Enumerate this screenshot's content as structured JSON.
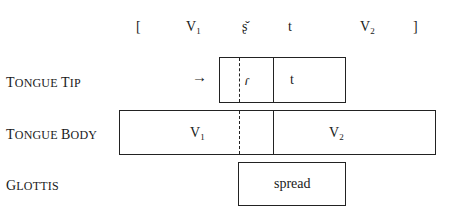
{
  "transcription": {
    "open_bracket": "[",
    "segments": [
      {
        "base": "V",
        "sub": "1"
      },
      {
        "base": "ʈ͡ʂ̌",
        "sub": ""
      },
      {
        "base": "t",
        "sub": ""
      },
      {
        "base": "V",
        "sub": "2"
      }
    ],
    "seg_v1_base": "V",
    "seg_v1_sub": "1",
    "seg_affricate": "ṣ̌",
    "seg_t": "t",
    "seg_v2_base": "V",
    "seg_v2_sub": "2",
    "close_bracket": "]"
  },
  "tiers": {
    "tongue_tip": {
      "label_first": "T",
      "label_rest": "ONGUE ",
      "label_first2": "T",
      "label_rest2": "IP",
      "label": "Tongue Tip",
      "arrow": "→",
      "cells": [
        "ɾ",
        "t"
      ]
    },
    "tongue_body": {
      "label_first": "T",
      "label_rest": "ONGUE ",
      "label_first2": "B",
      "label_rest2": "ODY",
      "label": "Tongue Body",
      "cells": [
        {
          "base": "V",
          "sub": "1"
        },
        {
          "base": "V",
          "sub": "2"
        }
      ],
      "v1_base": "V",
      "v1_sub": "1",
      "v2_base": "V",
      "v2_sub": "2"
    },
    "glottis": {
      "label_first": "G",
      "label_rest": "LOTTIS",
      "label": "Glottis",
      "cells": [
        "spread"
      ],
      "cell": "spread"
    }
  }
}
